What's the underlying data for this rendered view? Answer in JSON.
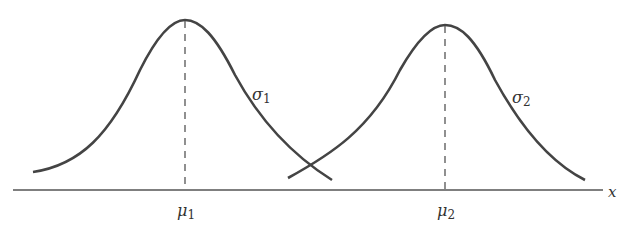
{
  "diagram": {
    "title": "",
    "axis_label": "x",
    "curves": [
      {
        "name": "curve-1",
        "mean_label": "μ",
        "mean_sub": "1",
        "sigma_label": "σ",
        "sigma_sub": "1"
      },
      {
        "name": "curve-2",
        "mean_label": "μ",
        "mean_sub": "2",
        "sigma_label": "σ",
        "sigma_sub": "2"
      }
    ],
    "colors": {
      "stroke": "#444444",
      "background": "#ffffff"
    }
  }
}
